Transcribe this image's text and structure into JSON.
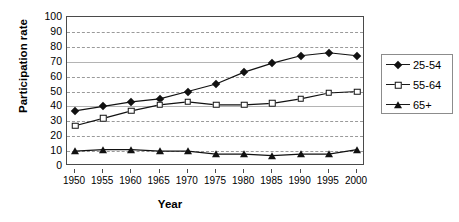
{
  "axis": {
    "ylabel": "Participation rate",
    "xlabel": "Year"
  },
  "legend": {
    "items": [
      {
        "label": "25-54",
        "marker": "diamond-marker-icon"
      },
      {
        "label": "55-64",
        "marker": "square-marker-icon"
      },
      {
        "label": "65+",
        "marker": "triangle-marker-icon"
      }
    ]
  },
  "chart_data": {
    "type": "line",
    "title": "",
    "xlabel": "Year",
    "ylabel": "Participation rate",
    "categories": [
      1950,
      1955,
      1960,
      1965,
      1970,
      1975,
      1980,
      1985,
      1990,
      1995,
      2000
    ],
    "xtick_labels": [
      "1950",
      "1955",
      "1960",
      "1965",
      "1970",
      "1975",
      "1980",
      "1985",
      "1990",
      "1995",
      "2000"
    ],
    "ytick_labels": [
      "0",
      "10",
      "20",
      "30",
      "40",
      "50",
      "60",
      "70",
      "80",
      "90",
      "100"
    ],
    "ylim": [
      0,
      100
    ],
    "ytick_step": 10,
    "grid": true,
    "legend_position": "right",
    "series": [
      {
        "name": "25-54",
        "marker": "diamond",
        "color": "#111111",
        "values": [
          37,
          40,
          43,
          45,
          50,
          55,
          63,
          69,
          74,
          76,
          74
        ]
      },
      {
        "name": "55-64",
        "marker": "square",
        "color": "#111111",
        "values": [
          27,
          32,
          37,
          41,
          43,
          41,
          41,
          42,
          45,
          49,
          50
        ]
      },
      {
        "name": "65+",
        "marker": "triangle",
        "color": "#111111",
        "values": [
          10,
          11,
          11,
          10,
          10,
          8,
          8,
          7,
          8,
          8,
          11
        ]
      }
    ]
  }
}
